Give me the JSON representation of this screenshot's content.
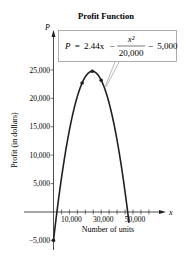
{
  "chart_data": {
    "type": "line",
    "title": "Profit Function",
    "xlabel": "Number of units",
    "ylabel": "Profit (in dollars)",
    "x_axis_symbol": "x",
    "y_axis_symbol": "P",
    "equation": {
      "lhs": "P",
      "eq": "=",
      "term1": "2.44x",
      "minus1": "−",
      "numerator": "x²",
      "denominator": "20,000",
      "minus2": "−",
      "term3": "5,000"
    },
    "x_ticks": [
      5000,
      10000,
      15000,
      20000,
      25000,
      30000,
      35000,
      40000,
      45000,
      50000,
      55000,
      60000
    ],
    "x_tick_labels": [
      {
        "value": 10000,
        "label": "10,000"
      },
      {
        "value": 30000,
        "label": "30,000"
      },
      {
        "value": 50000,
        "label": "50,000"
      }
    ],
    "y_tick_labels": [
      {
        "value": 25000,
        "label": "25,000"
      },
      {
        "value": 20000,
        "label": "20,000"
      },
      {
        "value": 15000,
        "label": "15,000"
      },
      {
        "value": 10000,
        "label": "10,000"
      },
      {
        "value": 5000,
        "label": "5,000"
      },
      {
        "value": -5000,
        "label": "−5,000"
      }
    ],
    "xlim": [
      0,
      60000
    ],
    "ylim": [
      -5000,
      25000
    ],
    "series": [
      {
        "name": "P = 2.44x − x²/20,000 − 5,000",
        "function": {
          "a": -5e-05,
          "b": 2.44,
          "c": -5000
        },
        "x_range": [
          0,
          47500
        ],
        "highlight_points": [
          {
            "x": 0,
            "y": -5000
          },
          {
            "x": 18000,
            "y": 22720
          },
          {
            "x": 24400,
            "y": 24768
          },
          {
            "x": 30000,
            "y": 23200
          }
        ]
      }
    ],
    "grid": false,
    "legend": "none"
  }
}
